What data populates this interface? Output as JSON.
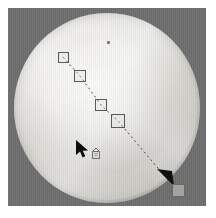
{
  "app": {
    "title": "Drag path overlay on circular dish",
    "type": "computer-use-screenshot"
  },
  "canvas": {
    "label": "image-viewport",
    "background_color": "#6e6e6e",
    "matte_color": "#ffffff",
    "width": 198,
    "height": 198
  },
  "subject": {
    "name": "circular-dish",
    "shape": "circle",
    "base_color": "#dedcd7",
    "highlight_color": "#f2f1ee",
    "shadow_color": "#c8c6c0"
  },
  "overlay": {
    "path": {
      "name": "drag-path",
      "style": "dashed",
      "color": "#4a4a48",
      "dash": "2 3",
      "width": 1,
      "points": [
        {
          "x": 55,
          "y": 49
        },
        {
          "x": 72,
          "y": 68
        },
        {
          "x": 93,
          "y": 97
        },
        {
          "x": 110,
          "y": 113
        },
        {
          "x": 160,
          "y": 172
        }
      ]
    },
    "handles": [
      {
        "name": "waypoint-1",
        "x": 50,
        "y": 44,
        "size": 11
      },
      {
        "name": "waypoint-2",
        "x": 66,
        "y": 62,
        "size": 12
      },
      {
        "name": "waypoint-3",
        "x": 87,
        "y": 91,
        "size": 12
      },
      {
        "name": "waypoint-4",
        "x": 103,
        "y": 106,
        "size": 14
      }
    ],
    "end_handle": {
      "name": "drop-target-handle",
      "x": 164,
      "y": 176,
      "size": 13
    },
    "arrowhead": {
      "name": "path-arrowhead",
      "x": 156,
      "y": 166,
      "color": "#101010"
    },
    "top_marker": {
      "name": "anchor-dot",
      "x": 107,
      "y": 41
    },
    "cursor": {
      "name": "mouse-pointer",
      "x": 68,
      "y": 133,
      "color": "#0d0d0d"
    },
    "drag_ghost": {
      "name": "drag-ghost-icon",
      "x": 82,
      "y": 140,
      "color": "#6e6c68"
    }
  },
  "colors": {
    "accent": "#4a4a48",
    "arrow": "#101010",
    "handle_stroke": "#5a5a58",
    "canvas_gray": "#6e6e6e"
  }
}
